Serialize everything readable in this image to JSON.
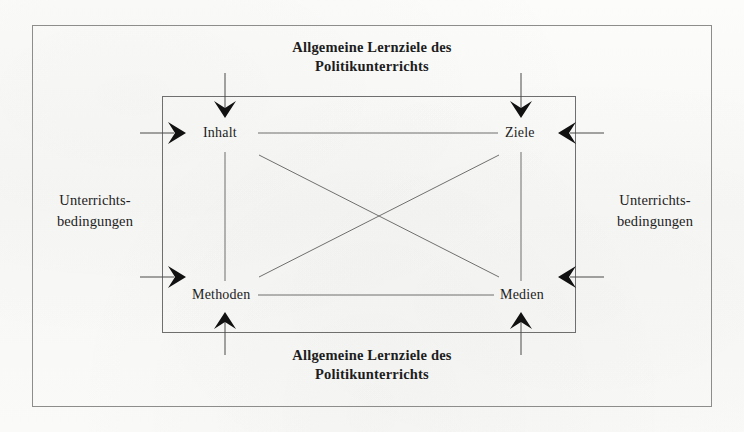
{
  "figure": {
    "type": "concept-diagram",
    "topic": "Didaktisches Strukturmodell des Politikunterrichts",
    "background_color": "#fbfbfa",
    "line_color": "#6f6f6f",
    "text_color": "#1d1d1d"
  },
  "titles": {
    "top": {
      "line1": "Allgemeine Lernziele des",
      "line2": "Politikunterrichts"
    },
    "bottom": {
      "line1": "Allgemeine Lernziele des",
      "line2": "Politikunterrichts"
    }
  },
  "side_labels": {
    "left": {
      "line1": "Unterrichts-",
      "line2": "bedingungen"
    },
    "right": {
      "line1": "Unterrichts-",
      "line2": "bedingungen"
    }
  },
  "nodes": [
    {
      "id": "inhalt",
      "label": "Inhalt",
      "position": "top-left"
    },
    {
      "id": "ziele",
      "label": "Ziele",
      "position": "top-right"
    },
    {
      "id": "methoden",
      "label": "Methoden",
      "position": "bottom-left"
    },
    {
      "id": "medien",
      "label": "Medien",
      "position": "bottom-right"
    }
  ],
  "connectors": [
    {
      "from": "inhalt",
      "to": "ziele",
      "style": "plain-line",
      "orientation": "horizontal"
    },
    {
      "from": "methoden",
      "to": "medien",
      "style": "plain-line",
      "orientation": "horizontal"
    },
    {
      "from": "inhalt",
      "to": "methoden",
      "style": "plain-line",
      "orientation": "vertical"
    },
    {
      "from": "ziele",
      "to": "medien",
      "style": "plain-line",
      "orientation": "vertical"
    },
    {
      "from": "inhalt",
      "to": "medien",
      "style": "plain-line",
      "orientation": "diagonal"
    },
    {
      "from": "methoden",
      "to": "ziele",
      "style": "plain-line",
      "orientation": "diagonal"
    }
  ],
  "arrows": [
    {
      "id": "arrow-top-left",
      "direction": "down",
      "target": "inhalt",
      "source": "top-title"
    },
    {
      "id": "arrow-top-right",
      "direction": "down",
      "target": "ziele",
      "source": "top-title"
    },
    {
      "id": "arrow-bottom-left",
      "direction": "up",
      "target": "methoden",
      "source": "bottom-title"
    },
    {
      "id": "arrow-bottom-right",
      "direction": "up",
      "target": "medien",
      "source": "bottom-title"
    },
    {
      "id": "arrow-left-upper",
      "direction": "right",
      "target": "inhalt",
      "source": "left-conditions"
    },
    {
      "id": "arrow-left-lower",
      "direction": "right",
      "target": "methoden",
      "source": "left-conditions"
    },
    {
      "id": "arrow-right-upper",
      "direction": "left",
      "target": "ziele",
      "source": "right-conditions"
    },
    {
      "id": "arrow-right-lower",
      "direction": "left",
      "target": "medien",
      "source": "right-conditions"
    }
  ]
}
